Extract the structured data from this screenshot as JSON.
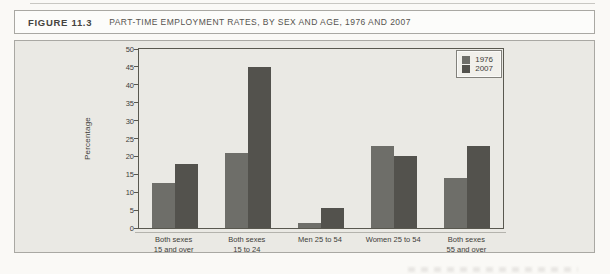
{
  "figure": {
    "label": "FIGURE 11.3",
    "title": "PART-TIME EMPLOYMENT RATES, BY SEX AND AGE, 1976 AND 2007"
  },
  "chart_data": {
    "type": "bar",
    "title": "PART-TIME EMPLOYMENT RATES, BY SEX AND AGE, 1976 AND 2007",
    "categories": [
      "Both sexes\n15 and over",
      "Both sexes\n15 to 24",
      "Men 25 to 54",
      "Women 25 to 54",
      "Both sexes\n55 and over"
    ],
    "series": [
      {
        "name": "1976",
        "color": "#6e6e69",
        "values": [
          12.5,
          21,
          1.5,
          23,
          14
        ]
      },
      {
        "name": "2007",
        "color": "#53524d",
        "values": [
          18,
          45,
          5.5,
          20,
          23
        ]
      }
    ],
    "xlabel": "",
    "ylabel": "Percentage",
    "ylim": [
      0,
      50
    ],
    "yticks": [
      0,
      5,
      10,
      15,
      20,
      25,
      30,
      35,
      40,
      45,
      50
    ],
    "grid": false,
    "legend_position": "top-right"
  },
  "colors": {
    "bar_1976": "#6e6e69",
    "bar_2007": "#53524d",
    "panel_background": "#eae9e4",
    "axis_line": "#59584f"
  }
}
